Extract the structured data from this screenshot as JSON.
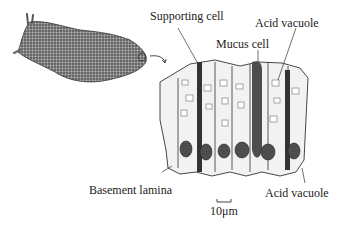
{
  "figure": {
    "organism": "sea slug (opisthobranch)",
    "labels": {
      "supporting_cell": "Supporting cell",
      "acid_vacuole_top": "Acid vacuole",
      "mucus_cell": "Mucus cell",
      "basement_lamina": "Basement lamina",
      "acid_vacuole_bottom": "Acid vacuole",
      "scale_bar": "10μm"
    },
    "colors": {
      "ink": "#222222",
      "stipple": "#555555",
      "background": "#ffffff"
    }
  }
}
